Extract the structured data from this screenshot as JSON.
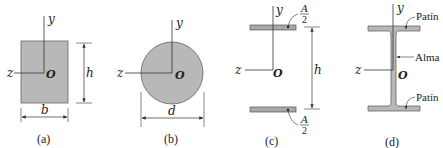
{
  "colors": {
    "fill": "#b8b8b8",
    "stroke": "#555555",
    "line": "#333333",
    "text": "#222222"
  },
  "panels": [
    {
      "id": "a",
      "caption": "(a)",
      "shape": "rectangle",
      "axis_y": "y",
      "axis_z": "z",
      "origin": "O",
      "height_label": "h",
      "width_label": "b"
    },
    {
      "id": "b",
      "caption": "(b)",
      "shape": "circle",
      "axis_y": "y",
      "axis_z": "z",
      "origin": "O",
      "diameter_label": "d"
    },
    {
      "id": "c",
      "caption": "(c)",
      "shape": "two-area idealized section",
      "axis_y": "y",
      "axis_z": "z",
      "origin": "O",
      "height_label": "h",
      "area_num": "A",
      "area_den": "2"
    },
    {
      "id": "d",
      "caption": "(d)",
      "shape": "wide-flange I-beam",
      "axis_y": "y",
      "axis_z": "z",
      "origin": "O",
      "flange_top_label": "Patín",
      "web_label": "Alma",
      "flange_bottom_label": "Patín"
    }
  ]
}
